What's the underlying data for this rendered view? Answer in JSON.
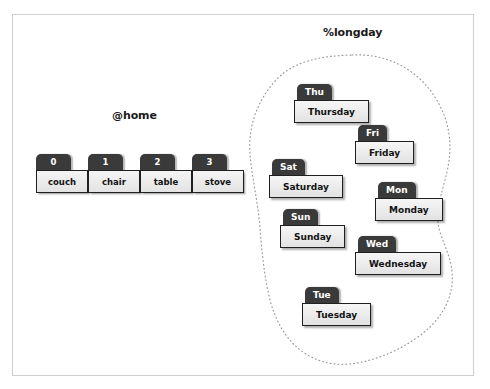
{
  "diagram": {
    "array_section": {
      "title": "@home",
      "indices": [
        "0",
        "1",
        "2",
        "3"
      ],
      "values": [
        "couch",
        "chair",
        "table",
        "stove"
      ]
    },
    "hash_section": {
      "title": "%longday",
      "entries": [
        {
          "key": "Thu",
          "value": "Thursday",
          "x": 297,
          "y": 84
        },
        {
          "key": "Fri",
          "value": "Friday",
          "x": 358,
          "y": 125
        },
        {
          "key": "Sat",
          "value": "Saturday",
          "x": 272,
          "y": 159
        },
        {
          "key": "Mon",
          "value": "Monday",
          "x": 378,
          "y": 182
        },
        {
          "key": "Sun",
          "value": "Sunday",
          "x": 283,
          "y": 209
        },
        {
          "key": "Wed",
          "value": "Wednesday",
          "x": 358,
          "y": 236
        },
        {
          "key": "Tue",
          "value": "Tuesday",
          "x": 305,
          "y": 287
        }
      ]
    },
    "colors": {
      "tab_fill": "#3a3a3a",
      "tab_text": "#ffffff",
      "cell_fill": "#ededed",
      "cell_border": "#1f1f1f",
      "cell_text": "#131313",
      "blob_stroke": "#9a9a9a",
      "frame_border": "#cfcfcf",
      "background": "#ffffff"
    }
  }
}
